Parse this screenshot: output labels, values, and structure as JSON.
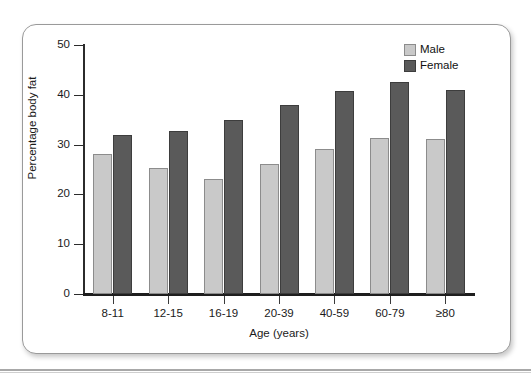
{
  "chart_data": {
    "type": "bar",
    "title": "",
    "xlabel": "Age (years)",
    "ylabel": "Percentage body fat",
    "categories": [
      "8-11",
      "12-15",
      "16-19",
      "20-39",
      "40-59",
      "60-79",
      "≥80"
    ],
    "series": [
      {
        "name": "Male",
        "color": "#c9c9c9",
        "values": [
          28.2,
          25.3,
          23.1,
          26.1,
          29.1,
          31.3,
          31.2
        ]
      },
      {
        "name": "Female",
        "color": "#5a5a5a",
        "values": [
          32.0,
          32.7,
          35.0,
          38.0,
          40.8,
          42.5,
          40.9
        ]
      }
    ],
    "ylim": [
      0,
      50
    ],
    "yticks": [
      0,
      10,
      20,
      30,
      40,
      50
    ],
    "ytick_labels": [
      "0",
      "10",
      "20",
      "30",
      "40",
      "50"
    ],
    "grid": false,
    "legend_position": "top-right"
  },
  "legend": {
    "items": [
      {
        "label": "Male"
      },
      {
        "label": "Female"
      }
    ]
  },
  "axes": {
    "x_title": "Age (years)",
    "y_title": "Percentage body fat"
  }
}
